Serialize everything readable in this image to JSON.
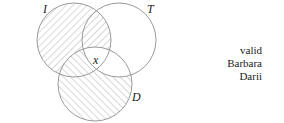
{
  "diagram": {
    "type": "venn-3",
    "sets": [
      {
        "id": "I",
        "label": "I",
        "cx": 74,
        "cy": 40,
        "r": 37,
        "hatch": "backslash"
      },
      {
        "id": "T",
        "label": "T",
        "cx": 119,
        "cy": 40,
        "r": 37,
        "hatch": "none"
      },
      {
        "id": "D",
        "label": "D",
        "cx": 95,
        "cy": 84,
        "r": 37,
        "hatch": "slash"
      }
    ],
    "center_mark": "x",
    "stroke_color": "#9a9a9a",
    "hatch_color": "#a8a8a8"
  },
  "side_labels": [
    "valid",
    "Barbara",
    "Darii"
  ]
}
